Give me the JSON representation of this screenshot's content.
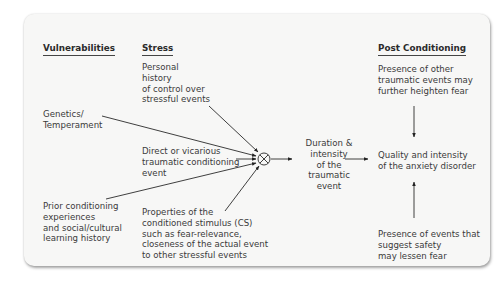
{
  "headers": {
    "vulnerabilities": "Vulnerabilities",
    "stress": "Stress",
    "post_conditioning": "Post Conditioning"
  },
  "vulnerabilities": {
    "genetics": "Genetics/\nTemperament",
    "prior": "Prior conditioning\nexperiences\nand social/cultural\nlearning history"
  },
  "stress": {
    "personal_history": "Personal\nhistory\nof control over\nstressful events",
    "direct_event": "Direct or vicarious\ntraumatic conditioning\nevent",
    "cs_properties": "Properties of the\nconditioned stimulus (CS)\nsuch as fear-relevance,\ncloseness of the actual event\nto other stressful events"
  },
  "middle": {
    "duration": "Duration &\nintensity\nof the\ntraumatic\nevent"
  },
  "post": {
    "heighten": "Presence of other\ntraumatic events may\nfurther heighten fear",
    "outcome": "Quality and intensity\nof the anxiety disorder",
    "lessen": "Presence of events that\nsuggest safety\nmay lessen fear"
  },
  "junction": {
    "symbol": "multiply-circle"
  }
}
